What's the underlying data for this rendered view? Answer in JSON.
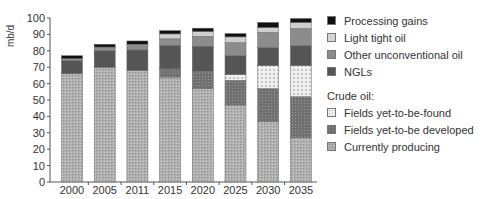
{
  "chart_data": {
    "type": "bar",
    "stacked": true,
    "title": "",
    "xlabel": "",
    "ylabel": "mb/d",
    "ylim": [
      0,
      100
    ],
    "yticks": [
      0,
      10,
      20,
      30,
      40,
      50,
      60,
      70,
      80,
      90,
      100
    ],
    "categories": [
      "2000",
      "2005",
      "2011",
      "2015",
      "2020",
      "2025",
      "2030",
      "2035"
    ],
    "series": [
      {
        "name": "Currently producing",
        "group": "Crude oil",
        "color": "#a8a8a8",
        "pattern": "dots-fine",
        "values": [
          66,
          70,
          68,
          64,
          57,
          47,
          37,
          27
        ]
      },
      {
        "name": "Fields yet-to-be developed",
        "group": "Crude oil",
        "color": "#6e6e6e",
        "pattern": "dots-dark",
        "values": [
          0,
          0,
          0,
          5,
          10,
          15,
          20,
          25
        ]
      },
      {
        "name": "Fields yet-to-be-found",
        "group": "Crude oil",
        "color": "#e8e8e8",
        "pattern": "dots-light",
        "values": [
          0,
          0,
          0,
          0.3,
          0.5,
          3.5,
          14,
          19
        ]
      },
      {
        "name": "NGLs",
        "group": "",
        "color": "#555555",
        "pattern": "solid",
        "values": [
          8,
          10,
          12.5,
          14,
          15.3,
          11.6,
          11,
          12.2
        ]
      },
      {
        "name": "Other unconventional oil",
        "group": "",
        "color": "#8c8c8c",
        "pattern": "solid",
        "values": [
          1.2,
          2.3,
          2.7,
          4,
          6,
          7.9,
          9.2,
          10.4
        ]
      },
      {
        "name": "Light tight oil",
        "group": "",
        "color": "#cfcfcf",
        "pattern": "solid",
        "values": [
          0,
          0,
          0.8,
          3,
          3,
          3.5,
          3,
          3.7
        ]
      },
      {
        "name": "Processing gains",
        "group": "",
        "color": "#111111",
        "pattern": "solid",
        "values": [
          1.8,
          1.7,
          2,
          2,
          2,
          2,
          3.1,
          2.4
        ]
      }
    ],
    "totals": [
      77,
      84,
      86,
      92,
      94,
      96,
      98,
      100
    ],
    "legend_position": "right",
    "grid": false
  },
  "legend": {
    "items_top": [
      {
        "label": "Processing gains",
        "color": "#111111"
      },
      {
        "label": "Light tight oil",
        "color": "#d6d6d6"
      },
      {
        "label": "Other unconventional oil",
        "color": "#8c8c8c"
      },
      {
        "label": "NGLs",
        "color": "#555555"
      }
    ],
    "crude_heading": "Crude oil:",
    "items_crude": [
      {
        "label": "Fields yet-to-be-found",
        "color": "#e8e8e8"
      },
      {
        "label": "Fields yet-to-be developed",
        "color": "#6e6e6e"
      },
      {
        "label": "Currently producing",
        "color": "#a8a8a8"
      }
    ]
  }
}
